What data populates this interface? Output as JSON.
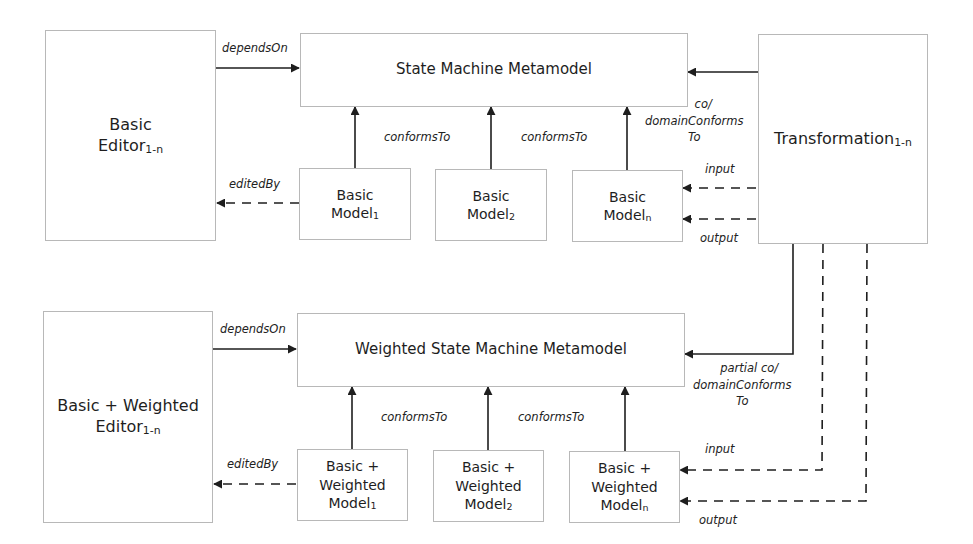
{
  "top": {
    "editor": {
      "line1": "Basic",
      "line2": "Editor",
      "sub": "1-n"
    },
    "metamodel": "State Machine Metamodel",
    "transformation": {
      "label": "Transformation",
      "sub": "1-n"
    },
    "models": [
      {
        "line1": "Basic",
        "line2": "Model",
        "sub": "1"
      },
      {
        "line1": "Basic",
        "line2": "Model",
        "sub": "2"
      },
      {
        "line1": "Basic",
        "line2": "Model",
        "sub": "n"
      }
    ],
    "labels": {
      "depends_on": "dependsOn",
      "edited_by": "editedBy",
      "conforms_to_1": "conformsTo",
      "conforms_to_2": "conformsTo",
      "co_domain_1": "co/",
      "co_domain_2": "domainConforms",
      "co_domain_3": "To",
      "input": "input",
      "output": "output"
    }
  },
  "bottom": {
    "editor": {
      "line1": "Basic + Weighted",
      "line2": "Editor",
      "sub": "1-n"
    },
    "metamodel": "Weighted State Machine Metamodel",
    "models": [
      {
        "line1": "Basic +",
        "line2": "Weighted",
        "line3": "Model",
        "sub": "1"
      },
      {
        "line1": "Basic +",
        "line2": "Weighted",
        "line3": "Model",
        "sub": "2"
      },
      {
        "line1": "Basic +",
        "line2": "Weighted",
        "line3": "Model",
        "sub": "n"
      }
    ],
    "labels": {
      "depends_on": "dependsOn",
      "edited_by": "editedBy",
      "conforms_to_1": "conformsTo",
      "conforms_to_2": "conformsTo",
      "partial_1": "partial co/",
      "partial_2": "domainConforms",
      "partial_3": "To",
      "input": "input",
      "output": "output"
    }
  },
  "colors": {
    "line": "#1e1e1e",
    "border": "#b8b8b8",
    "background": "#ffffff"
  }
}
